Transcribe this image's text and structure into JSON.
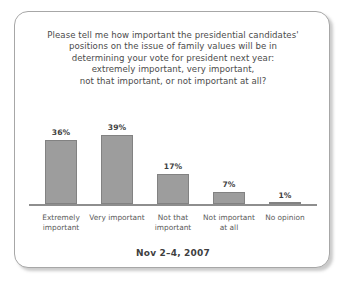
{
  "card": {
    "border_color": "#a7a7a7",
    "background": "#ffffff"
  },
  "question": {
    "lines": [
      "Please tell me how important the presidential candidates'",
      "positions on the issue of family values will be in",
      "determining your vote for president next year:",
      "extremely important, very important,",
      "not that important, or not important at all?"
    ]
  },
  "footer": {
    "date": "Nov 2–4, 2007"
  },
  "chart_data": {
    "type": "bar",
    "subtitle": "Nov 2–4, 2007",
    "xlabel": "",
    "ylabel": "",
    "ylim": [
      0,
      45
    ],
    "grid": false,
    "legend": "none",
    "categories": [
      "Extremely important",
      "Very important",
      "Not that important",
      "Not important at all",
      "No opinion"
    ],
    "category_lines": [
      [
        "Extremely",
        "important"
      ],
      [
        "Very important"
      ],
      [
        "Not that",
        "important"
      ],
      [
        "Not important",
        "at all"
      ],
      [
        "No opinion"
      ]
    ],
    "values": [
      36,
      39,
      17,
      7,
      1
    ],
    "data_labels": [
      "36%",
      "39%",
      "17%",
      "7%",
      "1%"
    ],
    "bar_color": "#9d9d9d",
    "bar_border_color": "#828282",
    "axis_color": "#8e8e8e"
  }
}
